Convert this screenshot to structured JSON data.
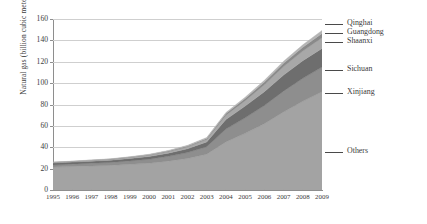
{
  "chart_data": {
    "type": "area",
    "title": "",
    "xlabel": "",
    "ylabel": "Natural gas (billion cubic meters)",
    "grid": true,
    "stacked": true,
    "legend_position": "right-callouts",
    "ylim": [
      0,
      160
    ],
    "yticks": [
      0,
      20,
      40,
      60,
      80,
      100,
      120,
      140,
      160
    ],
    "ytick_labels": [
      "0",
      "20",
      "40",
      "60",
      "80",
      "100",
      "120",
      "140",
      "160"
    ],
    "x": [
      1995,
      1996,
      1997,
      1998,
      1999,
      2000,
      2001,
      2002,
      2003,
      2004,
      2005,
      2006,
      2007,
      2008,
      2009
    ],
    "xtick_labels": [
      "1995",
      "1996",
      "1997",
      "1998",
      "1999",
      "2000",
      "2001",
      "2002",
      "2003",
      "2004",
      "2005",
      "2006",
      "2007",
      "2008",
      "2009"
    ],
    "series": [
      {
        "name": "Others",
        "color": "#a3a3a3",
        "values": [
          21.5,
          22.0,
          22.5,
          23.0,
          24.0,
          25.0,
          27.0,
          29.5,
          33.5,
          45.0,
          53.0,
          62.0,
          73.0,
          83.0,
          92.0
        ]
      },
      {
        "name": "Xinjiang",
        "color": "#8e8e8e",
        "values": [
          2.0,
          2.2,
          2.5,
          2.8,
          3.2,
          3.8,
          4.5,
          5.5,
          7.0,
          12.0,
          14.5,
          17.0,
          19.5,
          21.5,
          23.0
        ]
      },
      {
        "name": "Sichuan",
        "color": "#6e6e6e",
        "values": [
          1.8,
          1.9,
          2.0,
          2.1,
          2.3,
          2.6,
          3.0,
          3.6,
          4.5,
          9.0,
          11.0,
          13.0,
          15.0,
          16.5,
          17.5
        ]
      },
      {
        "name": "Shaanxi",
        "color": "#a8a8a8",
        "values": [
          0.4,
          0.5,
          0.6,
          0.7,
          0.9,
          1.1,
          1.4,
          1.8,
          2.3,
          4.0,
          5.0,
          6.5,
          8.0,
          9.0,
          10.0
        ]
      },
      {
        "name": "Guangdong",
        "color": "#8a8a8a",
        "values": [
          0.2,
          0.2,
          0.3,
          0.3,
          0.4,
          0.5,
          0.6,
          0.8,
          1.0,
          1.5,
          2.0,
          2.5,
          3.0,
          3.5,
          4.0
        ]
      },
      {
        "name": "Qinghai",
        "color": "#b5b5b5",
        "values": [
          0.2,
          0.2,
          0.2,
          0.3,
          0.3,
          0.4,
          0.5,
          0.6,
          0.8,
          1.0,
          1.3,
          1.6,
          2.0,
          2.3,
          2.8
        ]
      }
    ],
    "totals": [
      26.1,
      27.0,
      28.1,
      29.2,
      31.1,
      33.4,
      37.0,
      41.8,
      49.1,
      72.5,
      86.8,
      102.6,
      120.5,
      135.8,
      149.3
    ],
    "callouts": [
      {
        "label": "Qinghai",
        "y": 24
      },
      {
        "label": "Guangdong",
        "y": 33
      },
      {
        "label": "Shaanxi",
        "y": 42
      },
      {
        "label": "Sichuan",
        "y": 70
      },
      {
        "label": "Xinjiang",
        "y": 93
      },
      {
        "label": "Others",
        "y": 152
      }
    ]
  }
}
